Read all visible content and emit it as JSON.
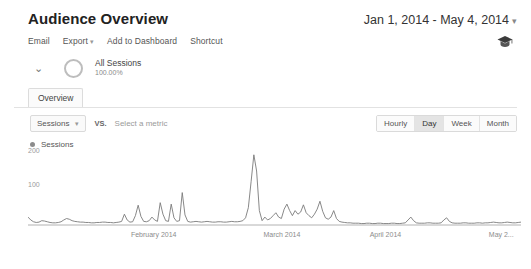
{
  "header": {
    "title": "Audience Overview",
    "date_range": "Jan 1, 2014 - May 4, 2014",
    "caret": "▾"
  },
  "toolbar": {
    "email": "Email",
    "export": "Export",
    "export_caret": "▾",
    "add_to_dashboard": "Add to Dashboard",
    "shortcut": "Shortcut",
    "academy_icon": "graduation-cap-icon"
  },
  "segment": {
    "chevron": "⌄",
    "name": "All Sessions",
    "percent": "100.00%"
  },
  "tabs": [
    {
      "label": "Overview",
      "selected": true
    }
  ],
  "metric_row": {
    "primary_metric": "Sessions",
    "caret": "▾",
    "vs_label": "VS.",
    "secondary_placeholder": "Select a metric",
    "granularity": [
      {
        "label": "Hourly",
        "selected": false
      },
      {
        "label": "Day",
        "selected": true
      },
      {
        "label": "Week",
        "selected": false
      },
      {
        "label": "Month",
        "selected": false
      }
    ]
  },
  "legend": {
    "series_label": "Sessions",
    "color": "#8c8c8c"
  },
  "chart_data": {
    "type": "line",
    "title": "Sessions",
    "xlabel": "",
    "ylabel": "Sessions",
    "ylim": [
      0,
      200
    ],
    "yticks": [
      100,
      200
    ],
    "grid": false,
    "legend_position": "top-left",
    "line_color": "#7a7a7a",
    "x_tick_labels": [
      {
        "label": "February 2014",
        "position_pct": 25.5
      },
      {
        "label": "March 2014",
        "position_pct": 51.5
      },
      {
        "label": "April 2014",
        "position_pct": 72.5
      },
      {
        "label": "May 2...",
        "position_pct": 96.0
      }
    ],
    "series": [
      {
        "name": "Sessions",
        "values": [
          22,
          14,
          9,
          7,
          8,
          12,
          11,
          9,
          7,
          6,
          6,
          7,
          9,
          14,
          18,
          16,
          12,
          10,
          9,
          8,
          8,
          7,
          7,
          6,
          6,
          7,
          7,
          8,
          8,
          7,
          7,
          6,
          7,
          8,
          10,
          30,
          14,
          8,
          9,
          26,
          55,
          24,
          10,
          9,
          12,
          22,
          14,
          10,
          62,
          30,
          12,
          10,
          58,
          20,
          10,
          12,
          90,
          28,
          10,
          8,
          9,
          10,
          9,
          8,
          9,
          10,
          9,
          8,
          8,
          9,
          9,
          8,
          8,
          9,
          10,
          9,
          9,
          10,
          12,
          20,
          48,
          120,
          195,
          150,
          40,
          12,
          22,
          14,
          18,
          26,
          34,
          22,
          18,
          44,
          58,
          40,
          26,
          40,
          30,
          36,
          56,
          34,
          26,
          20,
          30,
          44,
          66,
          38,
          20,
          16,
          22,
          40,
          18,
          10,
          8,
          7,
          6,
          6,
          5,
          5,
          5,
          4,
          4,
          5,
          5,
          4,
          4,
          5,
          5,
          4,
          4,
          4,
          5,
          5,
          4,
          4,
          5,
          6,
          14,
          22,
          12,
          6,
          5,
          5,
          5,
          6,
          6,
          5,
          5,
          5,
          6,
          14,
          20,
          10,
          6,
          5,
          5,
          5,
          6,
          6,
          5,
          5,
          5,
          6,
          6,
          5,
          6,
          6,
          7,
          8,
          7,
          6,
          6,
          7,
          8,
          7,
          6,
          6,
          7,
          8
        ]
      }
    ]
  }
}
